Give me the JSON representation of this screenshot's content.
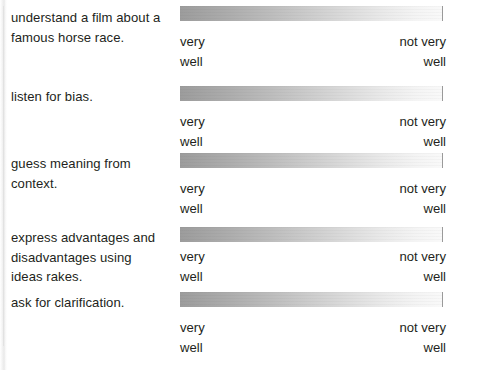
{
  "page": {
    "kind": "self-assessment-worksheet",
    "background_color": "#ffffff",
    "text_color": "#231f20"
  },
  "scale_legend": {
    "left_line1": "very",
    "left_line2": "well",
    "right_line1": "not very",
    "right_line2": "well",
    "gradient_start_color": "#9c9c9c",
    "gradient_end_color": "#f9f9f9"
  },
  "rows": [
    {
      "id": "understand-film",
      "prompt_lines": [
        "understand a film about a",
        "famous horse race."
      ]
    },
    {
      "id": "listen-for-bias",
      "prompt_lines": [
        "listen for bias."
      ]
    },
    {
      "id": "guess-meaning",
      "prompt_lines": [
        "guess meaning from",
        "context."
      ]
    },
    {
      "id": "express-advantages",
      "prompt_lines": [
        "express advantages and",
        "disadvantages using",
        "ideas rakes."
      ]
    },
    {
      "id": "ask-for-clarification",
      "prompt_lines": [
        "ask for clarification."
      ]
    }
  ]
}
